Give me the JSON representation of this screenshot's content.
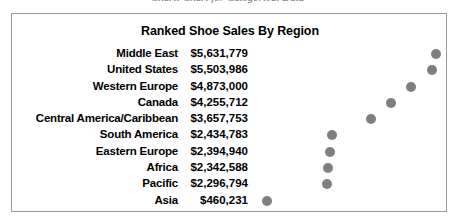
{
  "caption": {
    "text": "Chart: Chart for Categorical Data"
  },
  "chart": {
    "title": "Ranked Shoe Sales By Region",
    "dot_color": "#7f7f7f",
    "border_color": "#9a9a9a"
  },
  "chart_data": {
    "type": "scatter",
    "title": "Ranked Shoe Sales By Region",
    "xlabel": "",
    "ylabel": "",
    "grid": false,
    "legend": false,
    "orientation": "horizontal-dot-plot",
    "categories": [
      "Middle East",
      "United States",
      "Western Europe",
      "Canada",
      "Central America/Caribbean",
      "South America",
      "Eastern Europe",
      "Africa",
      "Pacific",
      "Asia"
    ],
    "values": [
      5631779,
      5503986,
      4873000,
      4255712,
      3657753,
      2434783,
      2394940,
      2342588,
      2296794,
      460231
    ],
    "value_labels": [
      "$5,631,779",
      "$5,503,986",
      "$4,873,000",
      "$4,255,712",
      "$3,657,753",
      "$2,434,783",
      "$2,394,940",
      "$2,342,588",
      "$2,296,794",
      "$460,231"
    ],
    "xlim": [
      0,
      6000000
    ],
    "rows": [
      {
        "label": "Middle East",
        "value": "$5,631,779",
        "dot_pct": 93.8
      },
      {
        "label": "United States",
        "value": "$5,503,986",
        "dot_pct": 91.7
      },
      {
        "label": "Western Europe",
        "value": "$4,873,000",
        "dot_pct": 81.2
      },
      {
        "label": "Canada",
        "value": "$4,255,712",
        "dot_pct": 70.9
      },
      {
        "label": "Central America/Caribbean",
        "value": "$3,657,753",
        "dot_pct": 60.9
      },
      {
        "label": "South America",
        "value": "$2,434,783",
        "dot_pct": 40.6
      },
      {
        "label": "Eastern Europe",
        "value": "$2,394,940",
        "dot_pct": 39.9
      },
      {
        "label": "Africa",
        "value": "$2,342,588",
        "dot_pct": 39.0
      },
      {
        "label": "Pacific",
        "value": "$2,296,794",
        "dot_pct": 38.3
      },
      {
        "label": "Asia",
        "value": "$460,231",
        "dot_pct": 7.7
      }
    ]
  }
}
